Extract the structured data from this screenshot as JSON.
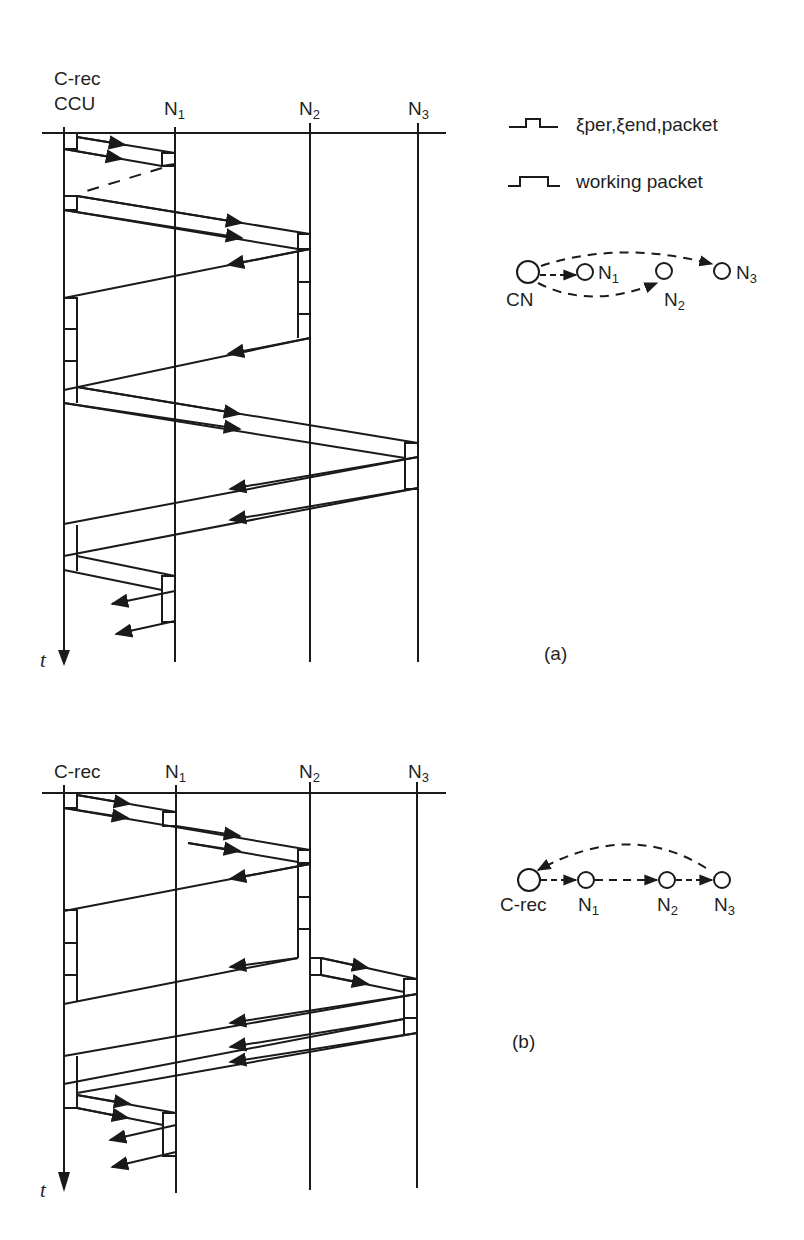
{
  "figure": {
    "panel_a": {
      "label": "(a)",
      "columns": [
        {
          "name": "C-rec",
          "name2": "CCU"
        },
        {
          "name": "N",
          "sub": "1"
        },
        {
          "name": "N",
          "sub": "2"
        },
        {
          "name": "N",
          "sub": "3"
        }
      ],
      "time_axis": "t",
      "legend": [
        {
          "symbol": "small-packet",
          "text": "ξper,ξend,packet"
        },
        {
          "symbol": "wide-packet",
          "text": "working packet"
        }
      ],
      "graph": {
        "nodes": [
          {
            "name": "CN"
          },
          {
            "name": "N",
            "sub": "1"
          },
          {
            "name": "N",
            "sub": "2"
          },
          {
            "name": "N",
            "sub": "3"
          }
        ]
      }
    },
    "panel_b": {
      "label": "(b)",
      "columns": [
        {
          "name": "C-rec"
        },
        {
          "name": "N",
          "sub": "1"
        },
        {
          "name": "N",
          "sub": "2"
        },
        {
          "name": "N",
          "sub": "3"
        }
      ],
      "time_axis": "t",
      "graph": {
        "nodes": [
          {
            "name": "C-rec"
          },
          {
            "name": "N",
            "sub": "1"
          },
          {
            "name": "N",
            "sub": "2"
          },
          {
            "name": "N",
            "sub": "3"
          }
        ]
      }
    }
  }
}
